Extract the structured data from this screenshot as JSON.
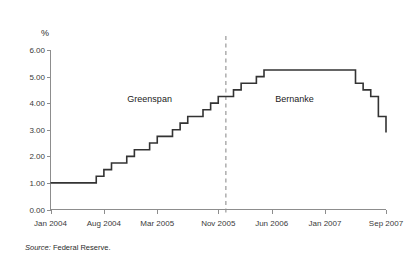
{
  "figure": {
    "source_note_prefix": "Source:",
    "source_note_body": " Federal Reserve."
  },
  "chart_data": {
    "type": "line",
    "line_style": "step",
    "title": "",
    "subtitle": "",
    "xlabel": "",
    "ylabel": "%",
    "ylim": [
      0.0,
      6.0
    ],
    "ytick_labels": [
      "0.00",
      "1.00",
      "2.00",
      "3.00",
      "4.00",
      "5.00",
      "6.00"
    ],
    "ytick_values": [
      0.0,
      1.0,
      2.0,
      3.0,
      4.0,
      5.0,
      6.0
    ],
    "xtick_labels": [
      "Jan 2004",
      "Aug 2004",
      "Mar 2005",
      "Nov 2005",
      "Jun 2006",
      "Jan 2007",
      "Sep 2007"
    ],
    "xtick_positions": [
      0,
      7,
      14,
      22,
      29,
      36,
      44
    ],
    "xlim": [
      0,
      44
    ],
    "grid": false,
    "legend": "none",
    "series": [
      {
        "name": "Federal funds target rate",
        "color": "#333333",
        "x": [
          0,
          1,
          2,
          3,
          4,
          5,
          6,
          7,
          8,
          9,
          10,
          11,
          12,
          13,
          14,
          15,
          16,
          17,
          18,
          19,
          20,
          21,
          22,
          23,
          24,
          25,
          26,
          27,
          28,
          29,
          30,
          31,
          32,
          33,
          34,
          35,
          36,
          37,
          38,
          39,
          40,
          41,
          42,
          43,
          44
        ],
        "values": [
          1.0,
          1.0,
          1.0,
          1.0,
          1.0,
          1.0,
          1.25,
          1.5,
          1.75,
          1.75,
          2.0,
          2.25,
          2.25,
          2.5,
          2.75,
          2.75,
          3.0,
          3.25,
          3.5,
          3.5,
          3.75,
          4.0,
          4.25,
          4.25,
          4.5,
          4.75,
          4.75,
          5.0,
          5.25,
          5.25,
          5.25,
          5.25,
          5.25,
          5.25,
          5.25,
          5.25,
          5.25,
          5.25,
          5.25,
          5.25,
          4.75,
          4.5,
          4.25,
          3.5,
          2.9
        ]
      }
    ],
    "annotations": [
      {
        "name": "greenspan-label",
        "text": "Greenspan",
        "x": 13,
        "y": 4.05
      },
      {
        "name": "bernanke-label",
        "text": "Bernanke",
        "x": 32,
        "y": 4.05
      }
    ],
    "reference_lines": [
      {
        "name": "chairman-transition-divider",
        "orientation": "vertical",
        "x": 23,
        "style": "dashed",
        "color": "#8f8f8f"
      }
    ]
  }
}
